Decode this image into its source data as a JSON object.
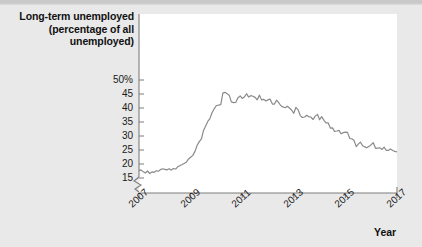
{
  "figure": {
    "yaxis_title_lines": [
      "Long-term unemployed",
      "(percentage of all",
      "unemployed)"
    ],
    "xaxis_title": "Year"
  },
  "chart_data": {
    "type": "line",
    "title": "Long-term unemployed (percentage of all unemployed)",
    "xlabel": "Year",
    "ylabel": "Long-term unemployed (percentage of all unemployed)",
    "xlim": [
      2007.0,
      2017.0
    ],
    "ylim": [
      14.0,
      50.0
    ],
    "yaxis_break": true,
    "grid": false,
    "legend": "none",
    "line_color": "#8a8a8a",
    "ytick_labels": [
      "15",
      "20",
      "25",
      "30",
      "35",
      "40",
      "45",
      "50%"
    ],
    "ytick_values": [
      15,
      20,
      25,
      30,
      35,
      40,
      45,
      50
    ],
    "xtick_labels": [
      "2007",
      "2009",
      "2011",
      "2013",
      "2015",
      "2017"
    ],
    "xtick_values": [
      2007,
      2009,
      2011,
      2013,
      2015,
      2017
    ],
    "series": [
      {
        "name": "Long-term unemployed share",
        "x": [
          2007.0,
          2007.08,
          2007.17,
          2007.25,
          2007.33,
          2007.42,
          2007.5,
          2007.58,
          2007.67,
          2007.75,
          2007.83,
          2007.92,
          2008.0,
          2008.08,
          2008.17,
          2008.25,
          2008.33,
          2008.42,
          2008.5,
          2008.58,
          2008.67,
          2008.75,
          2008.83,
          2008.92,
          2009.0,
          2009.08,
          2009.17,
          2009.25,
          2009.33,
          2009.42,
          2009.5,
          2009.58,
          2009.67,
          2009.75,
          2009.83,
          2009.92,
          2010.0,
          2010.08,
          2010.17,
          2010.25,
          2010.33,
          2010.42,
          2010.5,
          2010.58,
          2010.67,
          2010.75,
          2010.83,
          2010.92,
          2011.0,
          2011.08,
          2011.17,
          2011.25,
          2011.33,
          2011.42,
          2011.5,
          2011.58,
          2011.67,
          2011.75,
          2011.83,
          2011.92,
          2012.0,
          2012.08,
          2012.17,
          2012.25,
          2012.33,
          2012.42,
          2012.5,
          2012.58,
          2012.67,
          2012.75,
          2012.83,
          2012.92,
          2013.0,
          2013.08,
          2013.17,
          2013.25,
          2013.33,
          2013.42,
          2013.5,
          2013.58,
          2013.67,
          2013.75,
          2013.83,
          2013.92,
          2014.0,
          2014.08,
          2014.17,
          2014.25,
          2014.33,
          2014.42,
          2014.5,
          2014.58,
          2014.67,
          2014.75,
          2014.83,
          2014.92,
          2015.0,
          2015.08,
          2015.17,
          2015.25,
          2015.33,
          2015.42,
          2015.5,
          2015.58,
          2015.67,
          2015.75,
          2015.83,
          2015.92,
          2016.0,
          2016.08,
          2016.17,
          2016.25,
          2016.33,
          2016.42,
          2016.5,
          2016.58,
          2016.67,
          2016.75,
          2016.83,
          2016.92,
          2017.0
        ],
        "y": [
          17.6,
          17.9,
          17.2,
          16.8,
          17.5,
          16.6,
          17.2,
          17.0,
          17.6,
          17.4,
          18.0,
          18.3,
          18.1,
          17.9,
          18.3,
          17.8,
          18.4,
          18.2,
          19.0,
          19.4,
          19.8,
          20.2,
          20.6,
          21.8,
          22.4,
          23.0,
          24.5,
          26.6,
          27.9,
          29.0,
          32.0,
          33.5,
          35.3,
          36.2,
          38.3,
          39.8,
          40.9,
          41.0,
          41.2,
          45.3,
          45.6,
          45.1,
          44.5,
          42.2,
          41.9,
          42.0,
          43.6,
          44.3,
          43.4,
          43.9,
          45.1,
          43.9,
          44.4,
          44.2,
          43.8,
          42.9,
          44.6,
          42.9,
          43.1,
          42.5,
          42.9,
          43.2,
          41.4,
          41.4,
          42.8,
          41.8,
          40.8,
          40.4,
          40.1,
          40.6,
          40.0,
          39.2,
          38.1,
          40.2,
          39.3,
          37.3,
          36.6,
          36.8,
          37.4,
          36.9,
          36.7,
          35.9,
          37.1,
          37.7,
          35.8,
          36.9,
          35.6,
          34.7,
          34.7,
          32.8,
          32.9,
          31.6,
          31.8,
          32.0,
          30.8,
          31.2,
          31.4,
          31.3,
          29.1,
          29.0,
          28.5,
          26.2,
          27.1,
          27.8,
          26.5,
          26.1,
          25.8,
          26.3,
          26.9,
          27.6,
          25.6,
          25.7,
          25.8,
          25.2,
          26.0,
          24.9,
          24.9,
          25.4,
          24.8,
          24.5,
          24.3
        ]
      }
    ]
  }
}
